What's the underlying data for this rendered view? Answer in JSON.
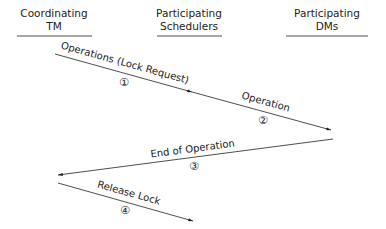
{
  "participants": [
    {
      "line1": "Coordinating",
      "line2": "TM"
    },
    {
      "line1": "Participating",
      "line2": "Schedulers"
    },
    {
      "line1": "Participating",
      "line2": "DMs"
    }
  ],
  "messages": [
    {
      "label": "Operations (Lock Request)",
      "step": "①"
    },
    {
      "label": "Operation",
      "step": "②"
    },
    {
      "label": "End of Operation",
      "step": "③"
    },
    {
      "label": "Release Lock",
      "step": "④"
    }
  ],
  "colors": {
    "line": "#222222",
    "background": "#ffffff"
  }
}
